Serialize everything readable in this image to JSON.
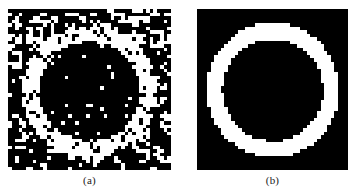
{
  "figure": {
    "background_color": "#ffffff",
    "panels": [
      {
        "id": "a",
        "caption": "(a)",
        "description": "noisy binary ring image with salt-and-pepper noise",
        "foreground_color": "#ffffff",
        "background_color": "#000000",
        "grid_cols": 46,
        "grid_rows": 46,
        "ring": {
          "center_x": 22.5,
          "center_y": 23.0,
          "outer_radius": 19.0,
          "inner_radius": 14.2
        },
        "noise": {
          "salt_probability_outside": 0.13,
          "salt_probability_inside": 0.055,
          "pepper_probability_on_ring": 0.16,
          "seed": 20240517
        }
      },
      {
        "id": "b",
        "caption": "(b)",
        "description": "restored clean binary ring image",
        "foreground_color": "#ffffff",
        "background_color": "#000000",
        "grid_cols": 44,
        "grid_rows": 46,
        "ring": {
          "center_x": 21.6,
          "center_y": 22.6,
          "outer_radius": 19.2,
          "inner_radius": 14.6
        },
        "noise": {
          "salt_probability_outside": 0.0,
          "salt_probability_inside": 0.0,
          "pepper_probability_on_ring": 0.0,
          "seed": 7
        },
        "defects": [
          {
            "type": "inner-notch",
            "col": 7,
            "row": 22,
            "w": 2,
            "h": 2
          },
          {
            "type": "outer-notch",
            "col": 21,
            "row": 44,
            "w": 1,
            "h": 2
          }
        ]
      }
    ]
  },
  "chart_data": {
    "type": "heatmap",
    "title": "",
    "xlabel": "",
    "ylabel": "",
    "legend": [],
    "annotations": [
      "(a)",
      "(b)"
    ],
    "series": [
      {
        "name": "(a) noisy ring",
        "grid_cols": 46,
        "grid_rows": 46,
        "values_summary": "binary 0/1 ring corrupted by salt-and-pepper noise"
      },
      {
        "name": "(b) restored ring",
        "grid_cols": 44,
        "grid_rows": 46,
        "values_summary": "binary 0/1 clean annulus"
      }
    ]
  }
}
